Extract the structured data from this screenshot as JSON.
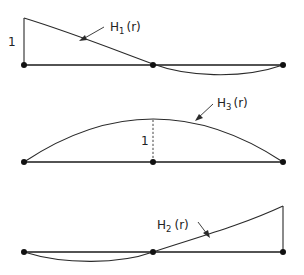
{
  "diagram": {
    "panels": [
      {
        "id": "H1",
        "label": {
          "base": "H",
          "sub": "1",
          "arg": "(r)"
        },
        "height_marker": "1",
        "description": "Value 1 at left node, zero at middle and right nodes, dips below axis between middle and right"
      },
      {
        "id": "H3",
        "label": {
          "base": "H",
          "sub": "3",
          "arg": "(r)"
        },
        "height_marker": "1",
        "description": "Bubble function: zero at end nodes, value 1 at middle node (dashed)"
      },
      {
        "id": "H2",
        "label": {
          "base": "H",
          "sub": "2",
          "arg": "(r)"
        },
        "height_marker": "",
        "description": "Value 1 at right node, zero at left and middle nodes, dips below axis between left and middle"
      }
    ],
    "nodes_per_element": 3,
    "colors": {
      "line": "#1a1a1a",
      "background": "#ffffff"
    }
  }
}
